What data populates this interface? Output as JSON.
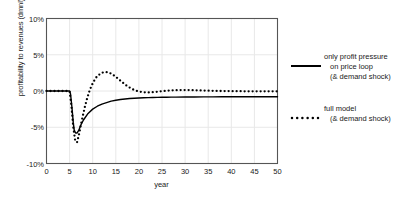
{
  "chart_data": {
    "type": "line",
    "title": "",
    "xlabel": "year",
    "ylabel": "profitability to revenues (dmnl)",
    "xlim": [
      0,
      50
    ],
    "ylim": [
      -0.1,
      0.1
    ],
    "xticks": [
      "0",
      "5",
      "10",
      "15",
      "20",
      "25",
      "30",
      "35",
      "40",
      "45",
      "50"
    ],
    "xtick_values": [
      0,
      5,
      10,
      15,
      20,
      25,
      30,
      35,
      40,
      45,
      50
    ],
    "yticks": [
      "10%",
      "5%",
      "0%",
      "-5%",
      "-10%"
    ],
    "ytick_values": [
      0.1,
      0.05,
      0.0,
      -0.05,
      -0.1
    ],
    "grid": "both-faint",
    "legend_position": "right",
    "series": [
      {
        "name": "only profit pressure on price loop (& demand shock)",
        "style": "solid",
        "color": "#000000",
        "x": [
          0,
          1,
          2,
          3,
          4,
          5,
          5.2,
          5.5,
          5.8,
          6,
          6.3,
          6.6,
          7,
          7.5,
          8,
          9,
          10,
          11,
          12,
          13,
          14,
          15,
          16,
          17,
          18,
          19,
          20,
          21,
          22,
          23,
          24,
          25,
          26,
          27,
          28,
          30,
          32,
          34,
          36,
          38,
          40,
          42,
          44,
          46,
          48,
          50
        ],
        "y": [
          0,
          0,
          0,
          0,
          0,
          0,
          -0.004,
          -0.022,
          -0.044,
          -0.054,
          -0.058,
          -0.058,
          -0.054,
          -0.046,
          -0.04,
          -0.031,
          -0.025,
          -0.021,
          -0.018,
          -0.016,
          -0.014,
          -0.0128,
          -0.0118,
          -0.011,
          -0.0104,
          -0.01,
          -0.0096,
          -0.0093,
          -0.0091,
          -0.0089,
          -0.0088,
          -0.0087,
          -0.0086,
          -0.0085,
          -0.0084,
          -0.0083,
          -0.0082,
          -0.0081,
          -0.0081,
          -0.008,
          -0.008,
          -0.008,
          -0.0079,
          -0.0079,
          -0.0079,
          -0.0079
        ]
      },
      {
        "name": "full model (& demand shock)",
        "style": "dotted",
        "color": "#000000",
        "x": [
          0,
          1,
          2,
          3,
          4,
          5,
          5.4,
          5.8,
          6.2,
          6.6,
          7,
          7.4,
          7.8,
          8.3,
          8.8,
          9.3,
          9.8,
          10.3,
          10.8,
          11.3,
          11.8,
          12.3,
          12.8,
          13.3,
          13.8,
          14.3,
          14.8,
          15.3,
          15.8,
          16.3,
          16.8,
          17.3,
          17.8,
          18.3,
          18.8,
          19.3,
          19.8,
          20.3,
          20.8,
          21.3,
          21.8,
          22.3,
          22.8,
          23.3,
          23.8,
          24.3,
          24.8,
          25.4,
          26,
          26.6,
          27.2,
          27.8,
          28.4,
          29,
          29.6,
          30.2,
          31,
          32,
          33,
          34,
          35,
          36,
          37,
          38,
          39,
          40,
          41,
          42,
          43,
          44,
          45,
          46,
          47,
          48,
          49,
          50
        ],
        "y": [
          0,
          0,
          0,
          0,
          0,
          0,
          -0.021,
          -0.05,
          -0.068,
          -0.071,
          -0.061,
          -0.048,
          -0.036,
          -0.022,
          -0.01,
          0.0,
          0.008,
          0.014,
          0.019,
          0.022,
          0.0245,
          0.0258,
          0.0262,
          0.0258,
          0.0246,
          0.0228,
          0.0205,
          0.018,
          0.0153,
          0.0126,
          0.01,
          0.0076,
          0.0054,
          0.0035,
          0.0019,
          0.0006,
          -0.0004,
          -0.0011,
          -0.0016,
          -0.0019,
          -0.002,
          -0.002,
          -0.0018,
          -0.0015,
          -0.0012,
          -0.0008,
          -0.0004,
          0.0,
          0.0004,
          0.0007,
          0.0009,
          0.0011,
          0.0012,
          0.0013,
          0.0013,
          0.0013,
          0.0012,
          0.001,
          0.0008,
          0.0006,
          0.0004,
          0.0002,
          0.0001,
          0.0,
          -0.0001,
          -0.0002,
          -0.0003,
          -0.0003,
          -0.0004,
          -0.0004,
          -0.0005,
          -0.0005,
          -0.0005,
          -0.0005,
          -0.0005,
          -0.0005
        ]
      }
    ]
  },
  "legend": {
    "entries": [
      {
        "line1": "only profit pressure",
        "line2": "on price loop",
        "line3": "(& demand shock)",
        "style": "solid"
      },
      {
        "line1": "full model",
        "line2": "(& demand shock)",
        "line3": "",
        "style": "dotted"
      }
    ]
  },
  "colors": {
    "axis": "#555555",
    "grid": "#e8e8e8",
    "series": "#000000",
    "text": "#1a1a1a",
    "background": "#ffffff"
  }
}
